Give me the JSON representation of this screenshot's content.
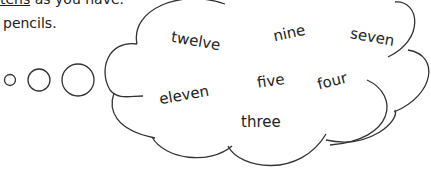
{
  "instruction": {
    "line1_underlined": "tens",
    "line1_rest": " as you have.",
    "line2": "pencils."
  },
  "thought_bubbles": [
    "small-circle",
    "medium-circle",
    "large-circle"
  ],
  "cloud_words": [
    "twelve",
    "nine",
    "seven",
    "eleven",
    "five",
    "four",
    "three"
  ]
}
